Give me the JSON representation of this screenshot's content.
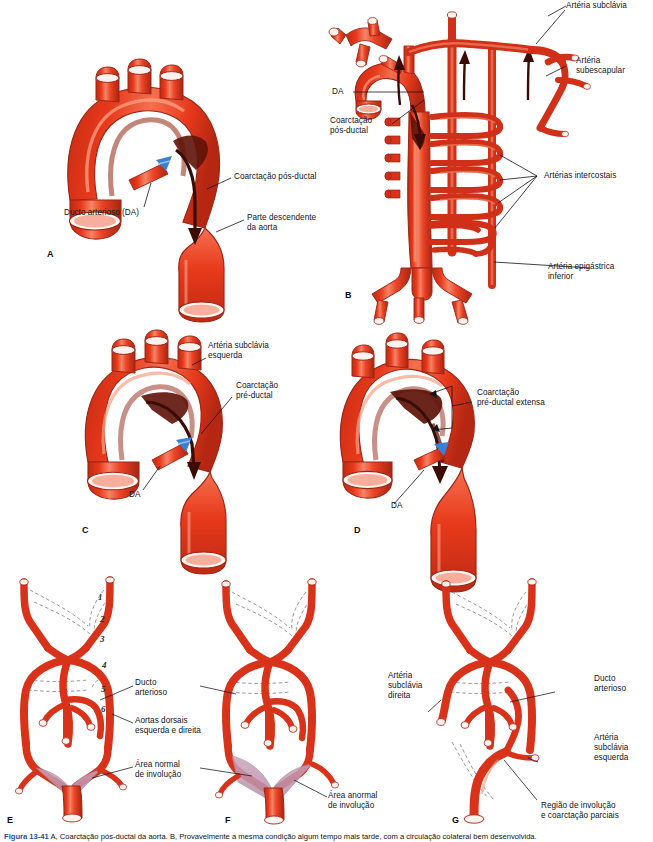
{
  "figure": {
    "id": "Figura 13-41",
    "caption_prefix": "Figura 13-41",
    "caption_text": "A, Coarctação pós-ductal da aorta. B, Provavelmente a mesma condição algum tempo mais tarde, com a circulação colateral bem desenvolvida.",
    "background": "#ffffff",
    "vessel_red": "#e8391b",
    "vessel_red_light": "#f2684a",
    "vessel_shadow": "#9e2616",
    "involution_purple": "#c19ab3",
    "duct_blue": "#3b7fd4",
    "dashed_gray": "#8d8d96",
    "text_color": "#14141e"
  },
  "panels": [
    {
      "letter": "A",
      "labels": [
        {
          "id": "coarctacao-pos-ductal-a",
          "text": "Coarctação pós-ductal"
        },
        {
          "id": "parte-descendente-aorta-a",
          "text": "Parte descendente\nda aorta"
        },
        {
          "id": "ducto-arterioso-da-a",
          "text": "Ducto arterioso (DA)"
        }
      ]
    },
    {
      "letter": "B",
      "labels": [
        {
          "id": "arteria-subclavia-b",
          "text": "Artéria subclávia"
        },
        {
          "id": "arteria-subescapular-b",
          "text": "Artéria\nsubescapular"
        },
        {
          "id": "arterias-intercostais-b",
          "text": "Artérias intercostais"
        },
        {
          "id": "arteria-epigastrica-inferior-b",
          "text": "Artéria epigástrica\ninferior"
        },
        {
          "id": "da-b",
          "text": "DA"
        },
        {
          "id": "coarctacao-pos-ductal-b",
          "text": "Coarctação\npós-ductal"
        }
      ]
    },
    {
      "letter": "C",
      "labels": [
        {
          "id": "arteria-subclavia-esquerda-c",
          "text": "Artéria subclávia\nesquerda"
        },
        {
          "id": "coarctacao-pre-ductal-c",
          "text": "Coarctação\npré-ductal"
        },
        {
          "id": "da-c",
          "text": "DA"
        }
      ]
    },
    {
      "letter": "D",
      "labels": [
        {
          "id": "coarctacao-pre-ductal-extensa-d",
          "text": "Coarctação\npré-ductal extensa"
        },
        {
          "id": "da-d",
          "text": "DA"
        }
      ]
    },
    {
      "letter": "E",
      "labels": [
        {
          "id": "ducto-arterioso-e",
          "text": "Ducto\narterioso"
        },
        {
          "id": "aortas-dorsais-e",
          "text": "Aortas dorsais\nesquerda e direita"
        },
        {
          "id": "area-normal-involucao-e",
          "text": "Área normal\nde involução"
        }
      ],
      "arch_numbers": [
        "1",
        "2",
        "3",
        "4",
        "5",
        "6"
      ]
    },
    {
      "letter": "F",
      "labels": [
        {
          "id": "area-anormal-involucao-f",
          "text": "Área anormal\nde involução"
        }
      ]
    },
    {
      "letter": "G",
      "labels": [
        {
          "id": "ducto-arterioso-g",
          "text": "Ducto\narterioso"
        },
        {
          "id": "arteria-subclavia-direita-g",
          "text": "Artéria\nsubclávia\ndireita"
        },
        {
          "id": "arteria-subclavia-esquerda-g",
          "text": "Artéria\nsubclávia\nesquerda"
        },
        {
          "id": "regiao-involucao-coarctacao-g",
          "text": "Região de involução\ne coarctação parciais"
        }
      ]
    }
  ]
}
